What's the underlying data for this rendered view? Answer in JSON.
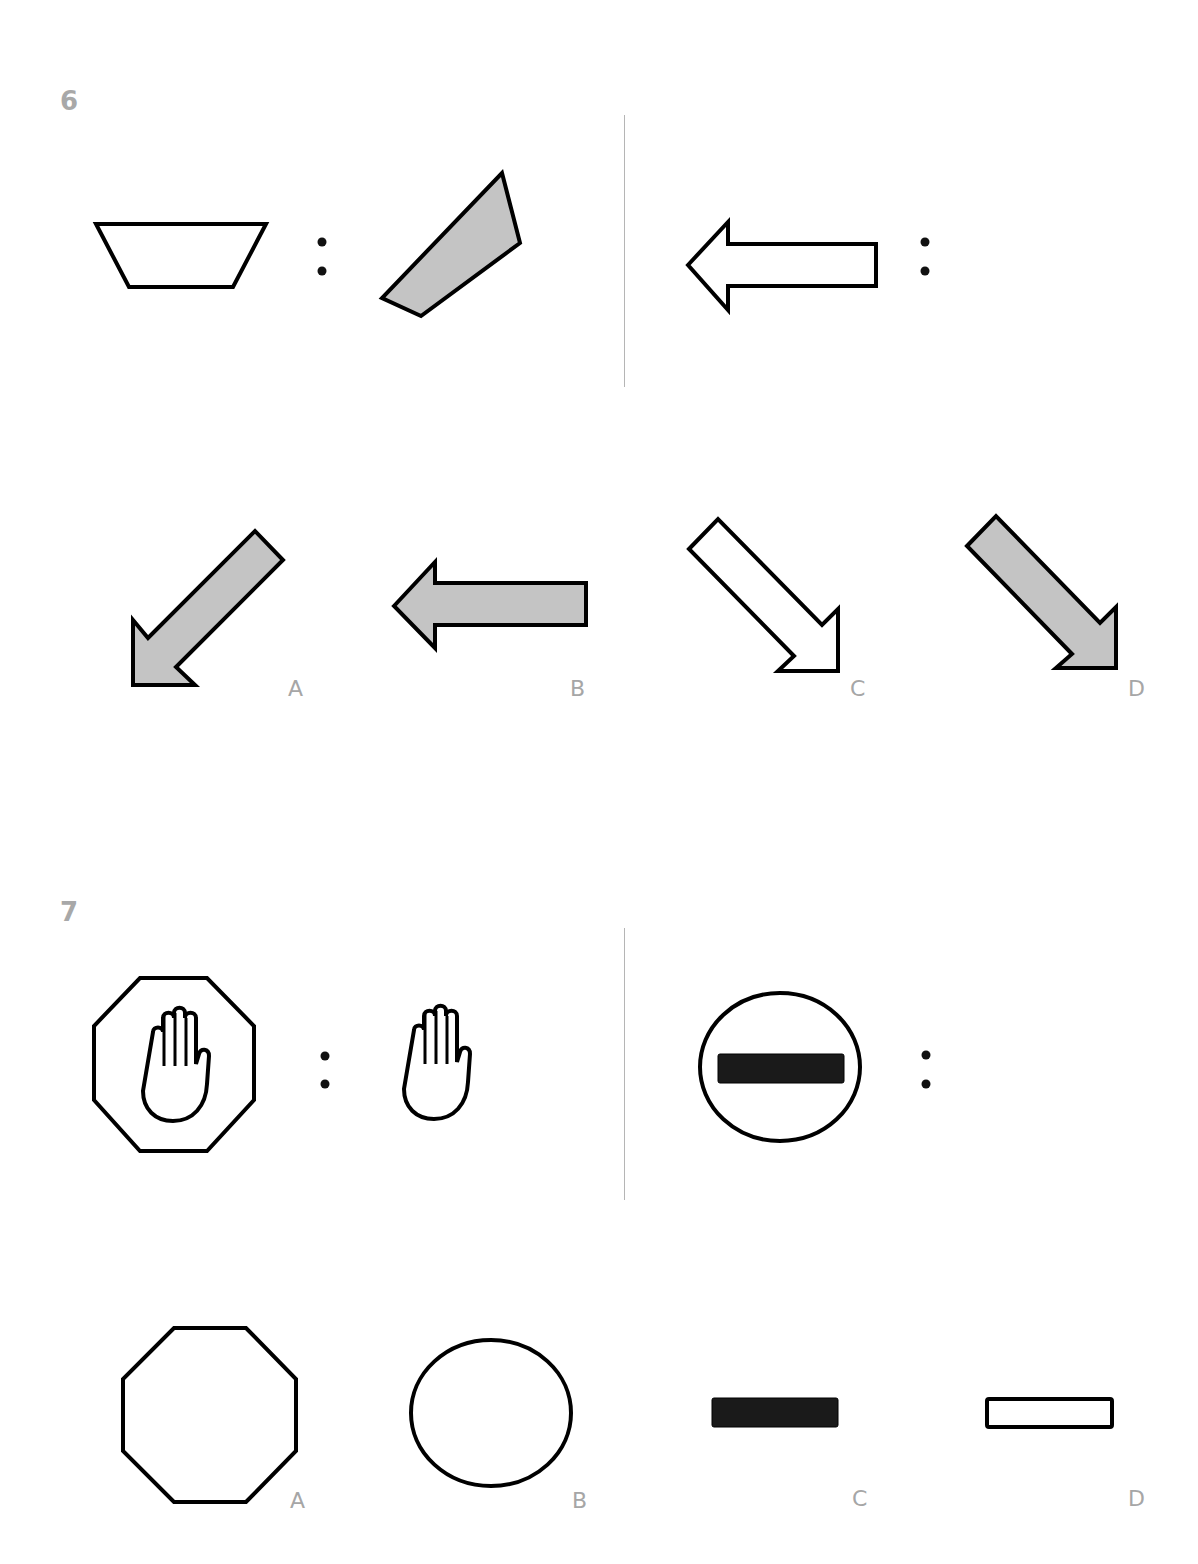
{
  "questions": [
    {
      "number": "6",
      "analogy": {
        "left_pair": [
          "white-trapezoid",
          "gray-rotated-trapezoid"
        ],
        "right_pair": [
          "white-left-arrow",
          "?"
        ],
        "separator": ":"
      },
      "options": [
        {
          "label": "A",
          "shape": "gray-arrow-down-left"
        },
        {
          "label": "B",
          "shape": "gray-arrow-left"
        },
        {
          "label": "C",
          "shape": "white-arrow-down-right"
        },
        {
          "label": "D",
          "shape": "gray-arrow-down-right"
        }
      ]
    },
    {
      "number": "7",
      "analogy": {
        "left_pair": [
          "octagon-with-hand",
          "hand"
        ],
        "right_pair": [
          "circle-with-bar",
          "?"
        ],
        "separator": ":"
      },
      "options": [
        {
          "label": "A",
          "shape": "octagon"
        },
        {
          "label": "B",
          "shape": "circle"
        },
        {
          "label": "C",
          "shape": "black-bar"
        },
        {
          "label": "D",
          "shape": "white-bar"
        }
      ]
    }
  ],
  "colors": {
    "fill_gray": "#c4c4c4",
    "stroke": "#000000",
    "label_gray": "#a6a6a6",
    "divider": "#b5b5b5"
  }
}
